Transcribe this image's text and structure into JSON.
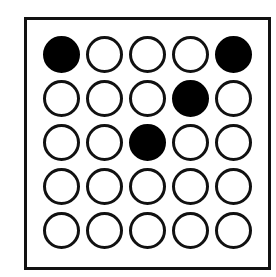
{
  "grid": {
    "rows": 5,
    "cols": 5,
    "filled_color": "#000000",
    "empty_color": "#ffffff",
    "stroke_color": "#111111",
    "cells": [
      [
        1,
        0,
        0,
        0,
        1
      ],
      [
        0,
        0,
        0,
        1,
        0
      ],
      [
        0,
        0,
        1,
        0,
        0
      ],
      [
        0,
        0,
        0,
        0,
        0
      ],
      [
        0,
        0,
        0,
        0,
        0
      ]
    ]
  }
}
